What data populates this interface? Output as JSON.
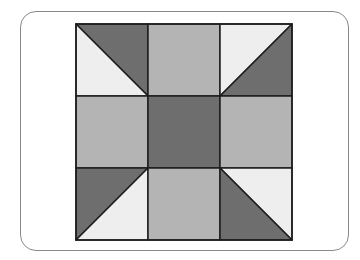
{
  "figure": {
    "colors": {
      "dark": "#6e6e6e",
      "medium": "#b4b4b4",
      "light": "#eeeeee",
      "line": "#1e1e1e",
      "frame": "#8a8a8a"
    },
    "grid": {
      "rows": 3,
      "cols": 3
    },
    "cells": [
      {
        "row": 0,
        "col": 0,
        "type": "hst",
        "diagonal": "tl-br",
        "upper": "dark",
        "lower": "light"
      },
      {
        "row": 0,
        "col": 1,
        "type": "solid",
        "fill": "medium"
      },
      {
        "row": 0,
        "col": 2,
        "type": "hst",
        "diagonal": "bl-tr",
        "upper": "light",
        "lower": "dark"
      },
      {
        "row": 1,
        "col": 0,
        "type": "solid",
        "fill": "medium"
      },
      {
        "row": 1,
        "col": 1,
        "type": "solid",
        "fill": "dark"
      },
      {
        "row": 1,
        "col": 2,
        "type": "solid",
        "fill": "medium"
      },
      {
        "row": 2,
        "col": 0,
        "type": "hst",
        "diagonal": "bl-tr",
        "upper": "dark",
        "lower": "light"
      },
      {
        "row": 2,
        "col": 1,
        "type": "solid",
        "fill": "medium"
      },
      {
        "row": 2,
        "col": 2,
        "type": "hst",
        "diagonal": "tl-br",
        "upper": "light",
        "lower": "dark"
      }
    ]
  }
}
